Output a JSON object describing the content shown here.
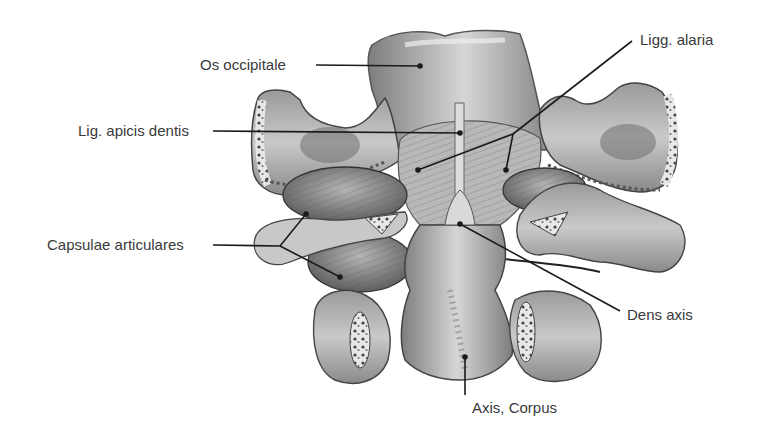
{
  "figure": {
    "labels": [
      {
        "id": "os_occipitale",
        "text": "Os occipitale",
        "x": 200,
        "y": 56
      },
      {
        "id": "lig_apicis_dentis",
        "text": "Lig. apicis dentis",
        "x": 78,
        "y": 122
      },
      {
        "id": "ligg_alaria",
        "text": "Ligg. alaria",
        "x": 640,
        "y": 31
      },
      {
        "id": "capsulae_articulares",
        "text": "Capsulae articulares",
        "x": 47,
        "y": 236
      },
      {
        "id": "dens_axis",
        "text": "Dens axis",
        "x": 627,
        "y": 306
      },
      {
        "id": "axis_corpus",
        "text": "Axis, Corpus",
        "x": 472,
        "y": 399
      }
    ],
    "leader_color": "#1a1a1a",
    "text_color": "#3a3a3a"
  }
}
